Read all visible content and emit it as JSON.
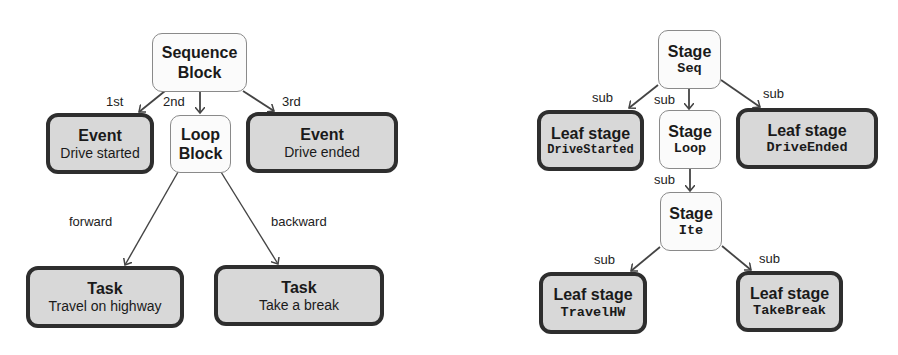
{
  "left_diagram": {
    "root": {
      "title": "Sequence",
      "subtitle": "Block"
    },
    "event_start": {
      "title": "Event",
      "subtitle": "Drive started"
    },
    "loop": {
      "title": "Loop",
      "subtitle": "Block"
    },
    "event_end": {
      "title": "Event",
      "subtitle": "Drive ended"
    },
    "task_forward": {
      "title": "Task",
      "subtitle": "Travel on highway"
    },
    "task_backward": {
      "title": "Task",
      "subtitle": "Take a break"
    },
    "edge_labels": {
      "first": "1st",
      "second": "2nd",
      "third": "3rd",
      "forward": "forward",
      "backward": "backward"
    }
  },
  "right_diagram": {
    "root": {
      "title": "Stage",
      "code": "Seq"
    },
    "leaf_start": {
      "title": "Leaf stage",
      "code": "DriveStarted"
    },
    "loop": {
      "title": "Stage",
      "code": "Loop"
    },
    "leaf_end": {
      "title": "Leaf stage",
      "code": "DriveEnded"
    },
    "ite": {
      "title": "Stage",
      "code": "Ite"
    },
    "leaf_travel": {
      "title": "Leaf stage",
      "code": "TravelHW"
    },
    "leaf_break": {
      "title": "Leaf stage",
      "code": "TakeBreak"
    },
    "edge_labels": {
      "sub1": "sub",
      "sub2": "sub",
      "sub3": "sub",
      "sub4": "sub",
      "sub5": "sub",
      "sub6": "sub"
    }
  },
  "colors": {
    "light_node_fill": "#fbfbfb",
    "dark_node_fill": "#d8d8d8",
    "dark_node_border": "#2e2e2e",
    "edge": "#444444"
  }
}
